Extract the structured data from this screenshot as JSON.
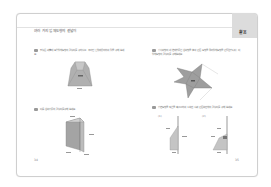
{
  "page": {
    "title": "여러 가지 입체도형의 겉넓이",
    "tab_label": "활용",
    "left_page_number": "34",
    "right_page_number": "35"
  },
  "left_column": {
    "questions": [
      {
        "number": "01",
        "text": "밑넓은 각뿔대 모양 입체도형의 겉넓이를 구하시오. 주어진 단위에 유의하여 답을 구해 보세요.",
        "figure": "truncated-pyramid"
      },
      {
        "number": "02",
        "text": "다음 삼각기둥의 겉넓이를 구해 보세요.",
        "figure": "triangular-prism"
      }
    ]
  },
  "right_column": {
    "questions": [
      {
        "number": "03",
        "text": "정사각형의 네 변에 합동인 삼각형을 붙여 만든 도형을 접어 입체도형을 만들었습니다. 이 입체도형의 겉넓이를 구해 보세요.",
        "figure": "four-pointed-star-net"
      },
      {
        "number": "04",
        "text": "평면도형을 직선을 축으로 하여 1회전 시켜 만든 회전체의 겉넓이를 구해 보세요.",
        "figure": "revolution-shapes",
        "sub_labels": [
          "(1)",
          "(2)"
        ]
      }
    ]
  },
  "colors": {
    "border": "#cfcfcf",
    "tab": "#dcdcdc",
    "figure_fill": "#a8a8a8",
    "figure_dark": "#8a8a8a"
  }
}
